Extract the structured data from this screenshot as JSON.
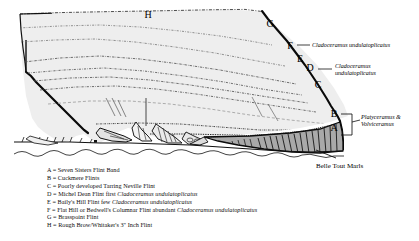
{
  "figure": {
    "colors": {
      "chalk_fill": "#eeeeee",
      "marls_fill": "#a9a9a9",
      "outline": "#000000",
      "background": "#ffffff"
    }
  },
  "markers": [
    {
      "id": "A",
      "label": "A"
    },
    {
      "id": "B",
      "label": "B"
    },
    {
      "id": "C",
      "label": "C"
    },
    {
      "id": "D",
      "label": "D"
    },
    {
      "id": "E",
      "label": "E"
    },
    {
      "id": "F",
      "label": "F"
    },
    {
      "id": "G",
      "label": "G"
    },
    {
      "id": "H",
      "label": "H"
    }
  ],
  "annotations": {
    "f_species": "Cladoceramus undulatoplicatus",
    "d_species_line1": "Cladoceramus",
    "d_species_line2": "undulatoplicatus",
    "ab_species_line1": "Platyceramus &",
    "ab_species_line2": "Volviceramus",
    "base_unit": "Belle Tout Marls"
  },
  "legend": [
    {
      "key": "A",
      "sep": " = ",
      "text_before": "Seven Sisters Flint Band",
      "species": "",
      "text_after": ""
    },
    {
      "key": "B",
      "sep": " = ",
      "text_before": "Cuckmere Flints",
      "species": "",
      "text_after": ""
    },
    {
      "key": "C",
      "sep": " = ",
      "text_before": "Poorly developed Tarring Neville Flint",
      "species": "",
      "text_after": ""
    },
    {
      "key": "D",
      "sep": " = ",
      "text_before": "Michel Dean Flint first ",
      "species": "Cladoceramus undulatoplicatus",
      "text_after": ""
    },
    {
      "key": "E",
      "sep": " = ",
      "text_before": "Baily's Hill Flint few ",
      "species": "Cladoceramus undulatoplicatus",
      "text_after": ""
    },
    {
      "key": "F",
      "sep": " = ",
      "text_before": "Flat Hill or Bedwell's Columnar Flint abundant ",
      "species": "Cladoceramus undulatoplicatus",
      "text_after": ""
    },
    {
      "key": "G",
      "sep": " = ",
      "text_before": "Brasspoint Flint",
      "species": "",
      "text_after": ""
    },
    {
      "key": "H",
      "sep": " = ",
      "text_before": "Rough Brow/Whitaker's 3\" Inch Flint",
      "species": "",
      "text_after": ""
    }
  ]
}
